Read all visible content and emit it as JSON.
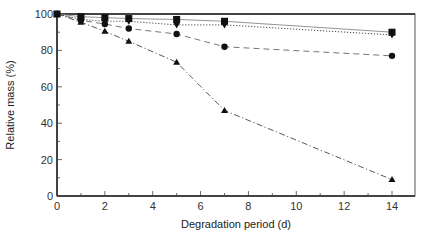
{
  "chart_data": {
    "type": "line",
    "title": "",
    "xlabel": "Degradation period (d)",
    "ylabel": "Relative mass (%)",
    "xlim": [
      0,
      14.9
    ],
    "ylim": [
      0,
      100
    ],
    "xticks": [
      0,
      2,
      4,
      6,
      8,
      10,
      12,
      14
    ],
    "yticks": [
      0,
      20,
      40,
      60,
      80,
      100
    ],
    "grid": false,
    "legend": "none",
    "x": [
      0,
      1,
      2,
      3,
      5,
      7,
      14
    ],
    "series": [
      {
        "name": "square",
        "marker": "square",
        "line": "solid",
        "values": [
          100,
          98.5,
          98,
          97.5,
          97,
          96,
          90
        ]
      },
      {
        "name": "inverted-triangle",
        "marker": "triangle-down",
        "line": "dotted",
        "values": [
          100,
          97,
          96,
          96,
          94,
          94,
          88.5
        ]
      },
      {
        "name": "circle",
        "marker": "circle",
        "line": "dashed",
        "values": [
          100,
          96.5,
          94.5,
          92,
          89,
          82,
          77
        ]
      },
      {
        "name": "triangle",
        "marker": "triangle-up",
        "line": "dashdot",
        "values": [
          100,
          95.5,
          90.5,
          85,
          73.5,
          47,
          9
        ]
      }
    ]
  }
}
